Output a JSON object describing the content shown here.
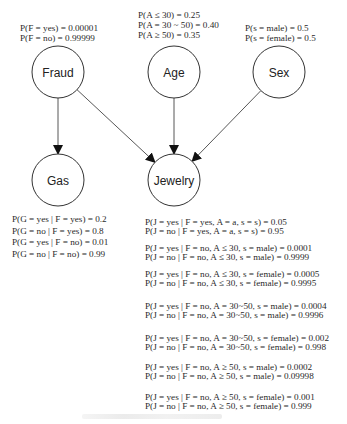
{
  "nodes": [
    {
      "id": "fraud",
      "label": "Fraud",
      "cx": 58,
      "cy": 72,
      "r": 26
    },
    {
      "id": "age",
      "label": "Age",
      "cx": 174,
      "cy": 72,
      "r": 26
    },
    {
      "id": "sex",
      "label": "Sex",
      "cx": 279,
      "cy": 72,
      "r": 26
    },
    {
      "id": "gas",
      "label": "Gas",
      "cx": 58,
      "cy": 180,
      "r": 26
    },
    {
      "id": "jewelry",
      "label": "Jewelry",
      "cx": 174,
      "cy": 180,
      "r": 26
    }
  ],
  "edges": [
    {
      "from": "fraud",
      "to": "gas"
    },
    {
      "from": "fraud",
      "to": "jewelry"
    },
    {
      "from": "age",
      "to": "jewelry"
    },
    {
      "from": "sex",
      "to": "jewelry"
    }
  ],
  "probabilities": {
    "fraud": [
      "P(F = yes) = 0.00001",
      "P(F = no) = 0.99999"
    ],
    "age": [
      "P(A ≤ 30) = 0.25",
      "P(A = 30 ~ 50) = 0.40",
      "P(A ≥ 50) = 0.35"
    ],
    "sex": [
      "P(s = male) = 0.5",
      "P(s = female) = 0.5"
    ],
    "gas": [
      "P(G = yes | F = yes) = 0.2",
      "P(G = no | F = yes) = 0.8",
      "P(G = yes | F = no) = 0.01",
      "P(G = no | F = no) = 0.99"
    ],
    "jewelry": [
      "P(J = yes | F = yes, A = a, s = s) = 0.05",
      "P(J = no  | F = yes, A = a, s = s) = 0.95",
      "P(J = yes | F = no, A ≤ 30, s = male) = 0.0001",
      "P(J = no | F = no, A ≤ 30, s = male) = 0.9999",
      "P(J = yes | F = no, A ≤ 30, s = female) = 0.0005",
      "P(J = no | F = no, A ≤ 30, s = female) = 0.9995",
      "P(J = yes | F = no, A = 30~50, s = male) = 0.0004",
      "P(J = no | F = no, A = 30~50, s = male) = 0.9996",
      "P(J = yes | F = no, A = 30~50, s = female) = 0.002",
      "P(J = no | F = no, A = 30~50, s = female) = 0.998",
      "P(J = yes | F = no, A ≥ 50, s = male) = 0.0002",
      "P(J = no | F = no, A ≥ 50, s = male) = 0.09998",
      "P(J = yes | F = no, A ≥ 50, s = female) = 0.001",
      "P(J = no | F = no, A ≥ 50, s = female) = 0.999"
    ]
  }
}
